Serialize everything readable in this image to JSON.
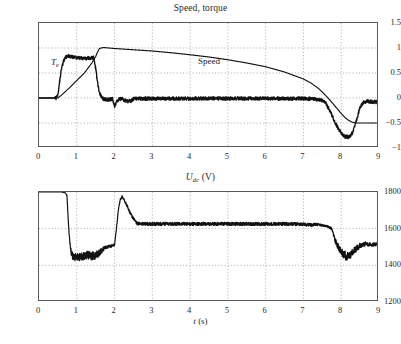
{
  "figure": {
    "background": "#ffffff",
    "trace_color": "#111111"
  },
  "panels": {
    "top": {
      "title": "Speed, torque",
      "annotations": [
        {
          "name": "torque-label",
          "text": "T",
          "sub": "e"
        },
        {
          "name": "speed-label",
          "text": "Speed"
        }
      ]
    },
    "bottom": {
      "title_main": "U",
      "title_sub": "dc",
      "title_unit": " (V)",
      "xlabel_var": "t",
      "xlabel_unit": " (s)"
    }
  },
  "chart_data": [
    {
      "type": "line",
      "name": "speed-torque-plot",
      "title": "Speed, torque",
      "xlabel": "",
      "ylabel": "",
      "xlim": [
        0,
        9
      ],
      "ylim": [
        -1,
        1.5
      ],
      "xticks": [
        0,
        1,
        2,
        3,
        4,
        5,
        6,
        7,
        8,
        9
      ],
      "yticks": [
        -1,
        -0.5,
        0,
        0.5,
        1,
        1.5
      ],
      "grid": true,
      "legend": "inline-annotations",
      "annotations": [
        {
          "label": "Te",
          "x": 0.62,
          "y": 0.72
        },
        {
          "label": "Speed",
          "x": 4.45,
          "y": 0.78
        }
      ],
      "series": [
        {
          "name": "Speed",
          "noise": 0.0,
          "x": [
            0,
            0.5,
            0.6,
            0.8,
            1.0,
            1.2,
            1.4,
            1.5,
            1.55,
            1.6,
            1.7,
            2.0,
            2.5,
            3.0,
            3.5,
            4.0,
            4.5,
            5.0,
            5.5,
            6.0,
            6.5,
            7.0,
            7.2,
            7.4,
            7.5,
            7.6,
            7.7,
            7.8,
            7.9,
            8.0,
            8.1,
            8.2,
            8.3,
            8.4,
            8.5,
            8.7,
            9.0
          ],
          "y": [
            0,
            0.0,
            0.06,
            0.2,
            0.35,
            0.5,
            0.7,
            0.83,
            0.92,
            0.99,
            1.01,
            0.99,
            0.965,
            0.94,
            0.905,
            0.865,
            0.82,
            0.765,
            0.7,
            0.625,
            0.52,
            0.38,
            0.3,
            0.19,
            0.12,
            0.04,
            -0.04,
            -0.13,
            -0.22,
            -0.31,
            -0.39,
            -0.45,
            -0.485,
            -0.5,
            -0.5,
            -0.5,
            -0.5
          ]
        },
        {
          "name": "Te",
          "noise": 0.035,
          "x": [
            0,
            0.45,
            0.5,
            0.55,
            0.6,
            0.68,
            0.75,
            0.85,
            1.0,
            1.2,
            1.35,
            1.42,
            1.45,
            1.5,
            1.55,
            1.6,
            1.7,
            1.85,
            1.95,
            2.0,
            2.05,
            2.1,
            2.2,
            2.35,
            2.45,
            2.5,
            2.6,
            2.8,
            3.0,
            3.5,
            4.0,
            4.5,
            5.0,
            5.5,
            6.0,
            6.5,
            7.0,
            7.3,
            7.5,
            7.6,
            7.7,
            7.8,
            7.9,
            8.0,
            8.1,
            8.2,
            8.3,
            8.4,
            8.5,
            8.6,
            8.7,
            9.0
          ],
          "y": [
            0,
            0.0,
            0.08,
            0.35,
            0.62,
            0.8,
            0.84,
            0.83,
            0.8,
            0.79,
            0.8,
            0.81,
            0.8,
            0.6,
            0.3,
            0.1,
            -0.02,
            -0.03,
            -0.02,
            -0.17,
            -0.08,
            -0.03,
            -0.02,
            -0.07,
            -0.05,
            -0.02,
            -0.01,
            -0.01,
            -0.01,
            -0.01,
            -0.01,
            -0.01,
            -0.01,
            -0.01,
            -0.01,
            -0.01,
            -0.01,
            -0.02,
            -0.05,
            -0.12,
            -0.25,
            -0.42,
            -0.58,
            -0.7,
            -0.77,
            -0.78,
            -0.7,
            -0.45,
            -0.18,
            -0.08,
            -0.07,
            -0.08
          ]
        }
      ]
    },
    {
      "type": "line",
      "name": "udc-plot",
      "title": "Udc (V)",
      "xlabel": "t (s)",
      "ylabel": "",
      "xlim": [
        0,
        9
      ],
      "ylim": [
        1200,
        1800
      ],
      "xticks": [
        0,
        1,
        2,
        3,
        4,
        5,
        6,
        7,
        8,
        9
      ],
      "yticks": [
        1200,
        1400,
        1600,
        1800
      ],
      "grid": true,
      "series": [
        {
          "name": "Udc",
          "noise_profile": "variable",
          "x": [
            0,
            0.6,
            0.7,
            0.74,
            0.76,
            0.8,
            0.85,
            0.9,
            1.0,
            1.1,
            1.2,
            1.3,
            1.4,
            1.5,
            1.6,
            1.7,
            1.75,
            1.8,
            1.9,
            1.95,
            2.0,
            2.05,
            2.1,
            2.15,
            2.2,
            2.3,
            2.4,
            2.5,
            2.55,
            2.6,
            2.8,
            3.0,
            3.5,
            4.0,
            4.5,
            5.0,
            5.5,
            6.0,
            6.5,
            7.0,
            7.2,
            7.35,
            7.5,
            7.65,
            7.75,
            7.85,
            7.95,
            8.05,
            8.15,
            8.25,
            8.35,
            8.5,
            8.65,
            8.8,
            9.0
          ],
          "y": [
            1800,
            1800,
            1795,
            1780,
            1700,
            1560,
            1470,
            1448,
            1443,
            1448,
            1452,
            1455,
            1452,
            1455,
            1468,
            1487,
            1498,
            1500,
            1505,
            1508,
            1512,
            1600,
            1700,
            1760,
            1775,
            1740,
            1690,
            1655,
            1638,
            1628,
            1626,
            1626,
            1626,
            1626,
            1626,
            1626,
            1626,
            1626,
            1626,
            1624,
            1620,
            1624,
            1618,
            1612,
            1600,
            1530,
            1490,
            1462,
            1448,
            1458,
            1480,
            1508,
            1518,
            1512,
            1516
          ],
          "band": [
            4,
            4,
            4,
            6,
            10,
            18,
            30,
            40,
            42,
            44,
            44,
            44,
            45,
            44,
            36,
            26,
            20,
            16,
            14,
            12,
            10,
            10,
            10,
            12,
            12,
            14,
            14,
            16,
            18,
            18,
            18,
            18,
            18,
            18,
            18,
            18,
            18,
            18,
            18,
            18,
            16,
            14,
            12,
            10,
            14,
            30,
            42,
            48,
            48,
            44,
            38,
            28,
            22,
            20,
            20
          ]
        }
      ]
    }
  ]
}
